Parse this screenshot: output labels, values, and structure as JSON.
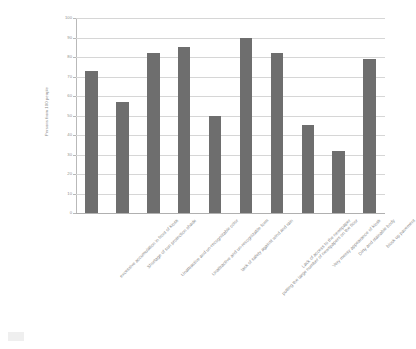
{
  "chart_data": {
    "type": "bar",
    "title": "",
    "xlabel": "",
    "ylabel": "Persons from 100 people",
    "ylim": [
      0,
      100
    ],
    "ytick_step": 10,
    "yticks": [
      0,
      10,
      20,
      30,
      40,
      50,
      60,
      70,
      80,
      90,
      100
    ],
    "grid": true,
    "legend": "none",
    "bar_color": "#6e6e6e",
    "grid_color": "#d6d6d6",
    "axis_color": "#b9b9b9",
    "label_color": "#8d8d8d",
    "categories": [
      "excessive accumulation in front of kiosk",
      "Shortage of sun protection shade",
      "Unattractive and un-recognizable color",
      "Unattractive and un-recognizable form",
      "lack of safety against wind and rain",
      "putting the large number of newspapers on the floor",
      "Lack of access to the newspaper",
      "Very messy appearance of  kiosk",
      "Dirty and stainable body",
      "block up pavement"
    ],
    "values": [
      73,
      57,
      82,
      85,
      50,
      90,
      82,
      45,
      32,
      79
    ]
  }
}
